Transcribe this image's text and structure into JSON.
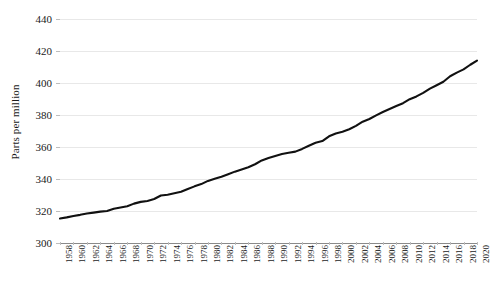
{
  "chart_data": {
    "type": "line",
    "title": "",
    "subtitle": "",
    "xlabel": "",
    "ylabel": "Parts per million",
    "xlim": [
      1958,
      2020
    ],
    "ylim": [
      300,
      440
    ],
    "grid": true,
    "legend": false,
    "legend_position": "none",
    "line_color": "#111111",
    "gridline_color": "#e8e8e8",
    "axis_color": "#8a8a8a",
    "y_ticks": [
      300,
      320,
      340,
      360,
      380,
      400,
      420,
      440
    ],
    "y_tick_labels": [
      "300",
      "320",
      "340",
      "360",
      "380",
      "400",
      "420",
      "440"
    ],
    "x_ticks": [
      1958,
      1960,
      1962,
      1964,
      1966,
      1968,
      1970,
      1972,
      1974,
      1976,
      1978,
      1980,
      1982,
      1984,
      1986,
      1988,
      1990,
      1992,
      1994,
      1996,
      1998,
      2000,
      2002,
      2004,
      2006,
      2008,
      2010,
      2012,
      2014,
      2016,
      2018,
      2020
    ],
    "x_tick_labels": [
      "1958",
      "1960",
      "1962",
      "1964",
      "1966",
      "1968",
      "1970",
      "1972",
      "1974",
      "1976",
      "1978",
      "1980",
      "1982",
      "1984",
      "1986",
      "1988",
      "1990",
      "1992",
      "1994",
      "1996",
      "1998",
      "2000",
      "2002",
      "2004",
      "2006",
      "2008",
      "2010",
      "2012",
      "2014",
      "2016",
      "2018",
      "2020"
    ],
    "x": [
      1958,
      1959,
      1960,
      1961,
      1962,
      1963,
      1964,
      1965,
      1966,
      1967,
      1968,
      1969,
      1970,
      1971,
      1972,
      1973,
      1974,
      1975,
      1976,
      1977,
      1978,
      1979,
      1980,
      1981,
      1982,
      1983,
      1984,
      1985,
      1986,
      1987,
      1988,
      1989,
      1990,
      1991,
      1992,
      1993,
      1994,
      1995,
      1996,
      1997,
      1998,
      1999,
      2000,
      2001,
      2002,
      2003,
      2004,
      2005,
      2006,
      2007,
      2008,
      2009,
      2010,
      2011,
      2012,
      2013,
      2014,
      2015,
      2016,
      2017,
      2018,
      2019,
      2020
    ],
    "values": [
      315.3,
      316.0,
      316.9,
      317.6,
      318.4,
      319.0,
      319.6,
      320.0,
      321.4,
      322.2,
      323.0,
      324.6,
      325.7,
      326.3,
      327.5,
      329.7,
      330.2,
      331.1,
      332.0,
      333.8,
      335.4,
      336.8,
      338.8,
      340.1,
      341.4,
      343.0,
      344.6,
      346.0,
      347.4,
      349.2,
      351.6,
      353.1,
      354.4,
      355.6,
      356.4,
      357.1,
      358.8,
      360.8,
      362.6,
      363.7,
      366.7,
      368.4,
      369.5,
      371.1,
      373.2,
      375.8,
      377.5,
      379.8,
      381.9,
      383.8,
      385.6,
      387.4,
      389.9,
      391.6,
      393.8,
      396.5,
      398.6,
      400.8,
      404.2,
      406.5,
      408.5,
      411.4,
      414.0
    ]
  },
  "axes": {
    "ylabel_text": "Parts per million"
  }
}
